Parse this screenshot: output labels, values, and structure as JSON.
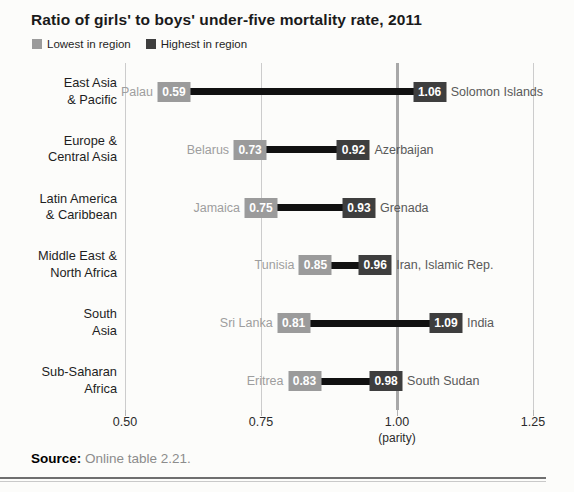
{
  "title": "Ratio of girls' to boys' under-five mortality rate, 2011",
  "legend": {
    "low_label": "Lowest in region",
    "high_label": "Highest in region"
  },
  "colors": {
    "low_box": "#9b9b9b",
    "high_box": "#3e3e3e",
    "connector_line": "#111111",
    "parity_gridline": "#a8a8a8",
    "gridline": "#cccccc",
    "low_country_text": "#9e9e9e",
    "high_country_text": "#595959"
  },
  "chart_data": {
    "type": "dumbbell-range",
    "title": "Ratio of girls' to boys' under-five mortality rate, 2011",
    "xlabel": "(parity)",
    "x_axis": {
      "min": 0.5,
      "max": 1.25,
      "ticks": [
        {
          "value": 0.5,
          "label": "0.50",
          "emphasis": false
        },
        {
          "value": 0.75,
          "label": "0.75",
          "emphasis": false
        },
        {
          "value": 1.0,
          "label": "1.00",
          "sublabel": "(parity)",
          "emphasis": true
        },
        {
          "value": 1.25,
          "label": "1.25",
          "emphasis": false
        }
      ]
    },
    "series_names": [
      "Lowest in region",
      "Highest in region"
    ],
    "rows": [
      {
        "region": "East Asia\n& Pacific",
        "low": {
          "country": "Palau",
          "value": 0.59
        },
        "high": {
          "country": "Solomon Islands",
          "value": 1.06
        }
      },
      {
        "region": "Europe &\nCentral Asia",
        "low": {
          "country": "Belarus",
          "value": 0.73
        },
        "high": {
          "country": "Azerbaijan",
          "value": 0.92
        }
      },
      {
        "region": "Latin America\n& Caribbean",
        "low": {
          "country": "Jamaica",
          "value": 0.75
        },
        "high": {
          "country": "Grenada",
          "value": 0.93
        }
      },
      {
        "region": "Middle East &\nNorth Africa",
        "low": {
          "country": "Tunisia",
          "value": 0.85
        },
        "high": {
          "country": "Iran, Islamic Rep.",
          "value": 0.96
        }
      },
      {
        "region": "South\nAsia",
        "low": {
          "country": "Sri Lanka",
          "value": 0.81
        },
        "high": {
          "country": "India",
          "value": 1.09
        }
      },
      {
        "region": "Sub-Saharan\nAfrica",
        "low": {
          "country": "Eritrea",
          "value": 0.83
        },
        "high": {
          "country": "South Sudan",
          "value": 0.98
        }
      }
    ]
  },
  "source": {
    "label": "Source:",
    "text": "Online table 2.21."
  }
}
